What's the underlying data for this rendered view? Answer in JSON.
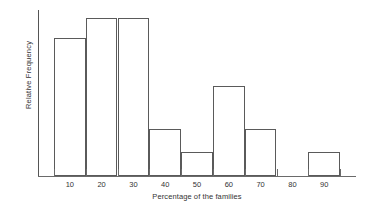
{
  "chart_data": {
    "type": "bar",
    "title": "",
    "subtitle": "",
    "xlabel": "Percentage of the families",
    "ylabel": "Relative Frequency",
    "categories": [
      "5-15",
      "15-25",
      "25-35",
      "35-45",
      "45-55",
      "55-65",
      "65-75",
      "75-85",
      "85-95"
    ],
    "bin_edges": [
      5,
      15,
      25,
      35,
      45,
      55,
      65,
      75,
      85,
      95
    ],
    "tick_labels": [
      "10",
      "20",
      "30",
      "40",
      "50",
      "60",
      "70",
      "80",
      "90"
    ],
    "tick_positions": [
      10,
      20,
      30,
      40,
      50,
      60,
      70,
      80,
      90
    ],
    "values": [
      0.87,
      1.0,
      1.0,
      0.3,
      0.15,
      0.57,
      0.3,
      0.0,
      0.15
    ],
    "xlim": [
      0,
      100
    ],
    "ylim": [
      0,
      1.05
    ],
    "grid": false,
    "legend": false,
    "legend_position": "none",
    "bar_style": {
      "fill": "#ffffff",
      "edge": "#5a5a5a"
    },
    "axis_color": "#6a6a6a",
    "background": "#ffffff",
    "y_tick_labels": []
  }
}
